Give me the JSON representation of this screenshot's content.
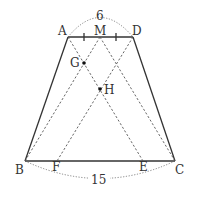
{
  "figure": {
    "type": "trapezoid-geometry",
    "points": {
      "A": {
        "label": "A",
        "x": 68,
        "y": 37
      },
      "D": {
        "label": "D",
        "x": 133,
        "y": 37
      },
      "M": {
        "label": "M",
        "x": 100,
        "y": 37
      },
      "B": {
        "label": "B",
        "x": 25,
        "y": 161
      },
      "C": {
        "label": "C",
        "x": 175,
        "y": 161
      },
      "F": {
        "label": "F",
        "x": 57,
        "y": 161
      },
      "E": {
        "label": "E",
        "x": 143,
        "y": 161
      },
      "G": {
        "label": "G",
        "x": 84,
        "y": 63
      },
      "H": {
        "label": "H",
        "x": 100,
        "y": 89
      }
    },
    "measurements": {
      "top": "6",
      "bottom": "15"
    }
  }
}
